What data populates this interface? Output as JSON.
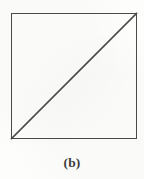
{
  "figure": {
    "caption": "(b)",
    "canvas": {
      "width": 144,
      "height": 179
    },
    "colors": {
      "background": "#fdfdfc",
      "stroke": "#4a4a4a",
      "caption_text": "#3d3d3d"
    },
    "shapes": {
      "square": {
        "name": "square-outline",
        "x": 11.5,
        "y": 13.5,
        "width": 125,
        "height": 125,
        "stroke_width": 1.6
      },
      "diagonal": {
        "name": "diagonal-line",
        "x1": 11.5,
        "y1": 138.5,
        "x2": 136.5,
        "y2": 13.5,
        "stroke_width": 1.6
      }
    }
  }
}
